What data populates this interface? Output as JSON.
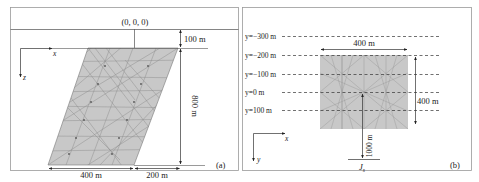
{
  "figure": {
    "panels": [
      {
        "id": "a",
        "tag": "(a)",
        "origin_label": "(0, 0, 0)",
        "axes": {
          "x": "x",
          "z": "z"
        },
        "dimensions": {
          "depth_offset": "100 m",
          "height": "800 m",
          "bottom_width": "400 m",
          "horizontal_offset": "200 m"
        },
        "mesh_fill": "#c8c8c8",
        "mesh_line": "#8a8a8a"
      },
      {
        "id": "b",
        "tag": "(b)",
        "axes": {
          "x": "x",
          "y": "y"
        },
        "y_levels": [
          "y=−300 m",
          "y=−200 m",
          "y=−100 m",
          "y=0 m",
          "y=100 m"
        ],
        "dimensions": {
          "width": "400 m",
          "height": "400 m",
          "source_distance": "1000 m"
        },
        "source_label": "J",
        "source_subscript": "s",
        "mesh_fill": "#c8c8c8",
        "mesh_line": "#9a9a9a"
      }
    ]
  }
}
